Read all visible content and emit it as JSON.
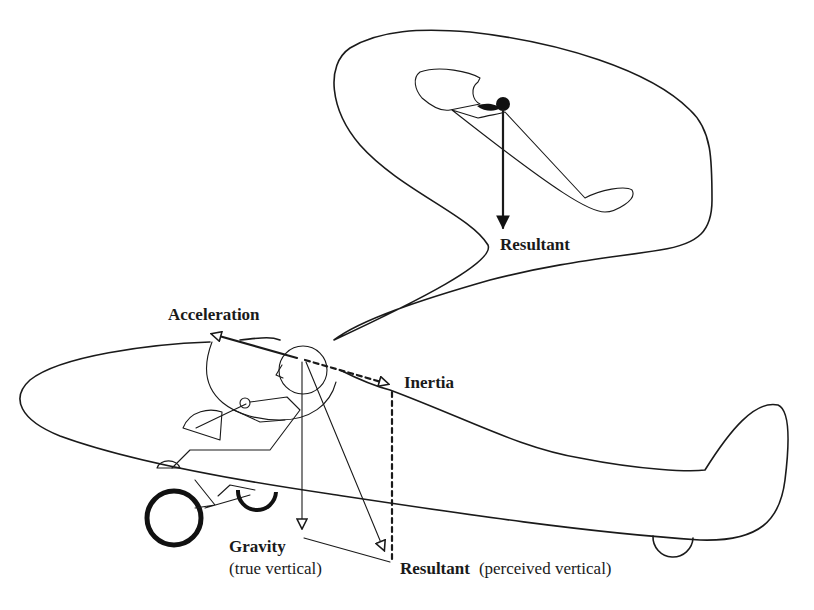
{
  "diagram": {
    "labels": {
      "bubble_resultant": "Resultant",
      "acceleration": "Acceleration",
      "inertia": "Inertia",
      "gravity": "Gravity",
      "gravity_note": "(true vertical)",
      "resultant": "Resultant",
      "resultant_note": "(perceived vertical)"
    },
    "forces": [
      {
        "name": "Acceleration",
        "direction": "forward",
        "line": "solid"
      },
      {
        "name": "Inertia",
        "direction": "backward",
        "line": "dashed"
      },
      {
        "name": "Gravity",
        "direction": "down (true vertical)",
        "line": "solid"
      },
      {
        "name": "Resultant",
        "direction": "down and backward (perceived vertical)",
        "line": "solid"
      }
    ],
    "thought_bubble": {
      "content": "Pilot perceives aircraft pitched nose-up",
      "arrow_label": "Resultant"
    },
    "colors": {
      "ink": "#1a1a1a",
      "background": "#ffffff"
    }
  }
}
